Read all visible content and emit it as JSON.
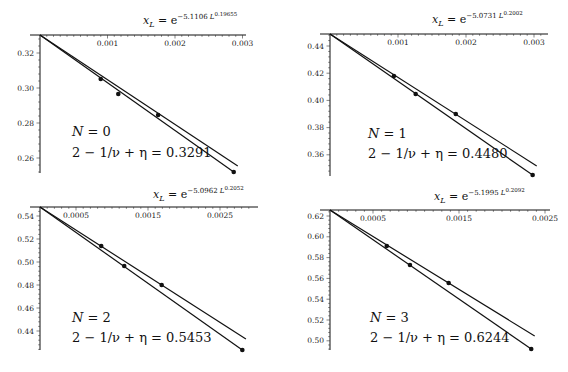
{
  "chart_data": [
    {
      "type": "line",
      "panel": "top-left",
      "title": "x_L = e^{-5.1106 L^{0.19655}}",
      "title_parts": {
        "var": "x",
        "sub": "L",
        "eq": " = e",
        "exp": "−5.1106 L",
        "exp2": "0.19655"
      },
      "annotation": {
        "line1": "N = 0",
        "line2": "2 − 1/ν + η = 0.3291"
      },
      "xlabel": "x_L",
      "ylabel": "",
      "x_ticks": [
        "0.001",
        "0.002",
        "0.003"
      ],
      "x_tick_values": [
        0.001,
        0.002,
        0.003
      ],
      "y_ticks": [
        "0.32",
        "0.30",
        "0.28",
        "0.26"
      ],
      "y_tick_values": [
        0.32,
        0.3,
        0.28,
        0.26
      ],
      "xlim": [
        0,
        0.003
      ],
      "ylim": [
        0.249,
        0.3291
      ],
      "intercept": 0.3291,
      "series": [
        {
          "name": "points",
          "x": [
            0.0009,
            0.00116,
            0.00175,
            0.00287
          ],
          "y": [
            0.3051,
            0.2966,
            0.2846,
            0.252
          ]
        },
        {
          "name": "fit upper",
          "x": [
            0,
            0.00293
          ],
          "y": [
            0.3291,
            0.2554
          ]
        },
        {
          "name": "fit lower",
          "x": [
            0,
            0.00287
          ],
          "y": [
            0.3291,
            0.252
          ]
        }
      ],
      "grid": false
    },
    {
      "type": "line",
      "panel": "top-right",
      "title": "x_L = e^{-5.0731 L^{0.2002}}",
      "title_parts": {
        "var": "x",
        "sub": "L",
        "eq": " = e",
        "exp": "−5.0731 L",
        "exp2": "0.2002"
      },
      "annotation": {
        "line1": "N = 1",
        "line2": "2 − 1/ν + η = 0.4480"
      },
      "xlabel": "x_L",
      "ylabel": "",
      "x_ticks": [
        "0.001",
        "0.002",
        "0.003"
      ],
      "x_tick_values": [
        0.001,
        0.002,
        0.003
      ],
      "y_ticks": [
        "0.44",
        "0.42",
        "0.40",
        "0.38",
        "0.36"
      ],
      "y_tick_values": [
        0.44,
        0.42,
        0.4,
        0.38,
        0.36
      ],
      "xlim": [
        0,
        0.0031
      ],
      "ylim": [
        0.343,
        0.448
      ],
      "intercept": 0.448,
      "series": [
        {
          "name": "points",
          "x": [
            0.00094,
            0.00126,
            0.00185,
            0.00298
          ],
          "y": [
            0.4179,
            0.4047,
            0.39,
            0.3451
          ]
        },
        {
          "name": "fit upper",
          "x": [
            0,
            0.00304
          ],
          "y": [
            0.448,
            0.3518
          ]
        },
        {
          "name": "fit lower",
          "x": [
            0,
            0.00298
          ],
          "y": [
            0.448,
            0.3451
          ]
        }
      ],
      "grid": false
    },
    {
      "type": "line",
      "panel": "bottom-left",
      "title": "x_L = e^{-5.0962 L^{0.2052}}",
      "title_parts": {
        "var": "x",
        "sub": "L",
        "eq": " = e",
        "exp": "−5.0962 L",
        "exp2": "0.2052"
      },
      "annotation": {
        "line1": "N = 2",
        "line2": "2 − 1/ν + η = 0.5453"
      },
      "xlabel": "x_L",
      "ylabel": "",
      "x_ticks": [
        "0.0005",
        "0.0015",
        "0.0025"
      ],
      "x_tick_values": [
        0.0005,
        0.0015,
        0.0025
      ],
      "y_ticks": [
        "0.54",
        "0.52",
        "0.50",
        "0.48",
        "0.46",
        "0.44"
      ],
      "y_tick_values": [
        0.54,
        0.52,
        0.5,
        0.48,
        0.46,
        0.44
      ],
      "xlim": [
        0,
        0.0029
      ],
      "ylim": [
        0.422,
        0.5453
      ],
      "intercept": 0.5453,
      "series": [
        {
          "name": "points",
          "x": [
            0.00085,
            0.00117,
            0.00169,
            0.00281
          ],
          "y": [
            0.5139,
            0.4965,
            0.48,
            0.4235
          ]
        },
        {
          "name": "fit upper",
          "x": [
            0,
            0.00286
          ],
          "y": [
            0.5453,
            0.433
          ]
        },
        {
          "name": "fit lower",
          "x": [
            0,
            0.00281
          ],
          "y": [
            0.5453,
            0.4235
          ]
        }
      ],
      "grid": false
    },
    {
      "type": "line",
      "panel": "bottom-right",
      "title": "x_L = e^{-5.1995 L^{0.2092}}",
      "title_parts": {
        "var": "x",
        "sub": "L",
        "eq": " = e",
        "exp": "−5.1995 L",
        "exp2": "0.2092"
      },
      "annotation": {
        "line1": "N = 3",
        "line2": "2 − 1/ν + η = 0.6244"
      },
      "xlabel": "x_L",
      "ylabel": "",
      "x_ticks": [
        "0.0005",
        "0.0015",
        "0.0025"
      ],
      "x_tick_values": [
        0.0005,
        0.0015,
        0.0025
      ],
      "y_ticks": [
        "0.62",
        "0.60",
        "0.58",
        "0.56",
        "0.54",
        "0.52",
        "0.50"
      ],
      "y_tick_values": [
        0.62,
        0.6,
        0.58,
        0.56,
        0.54,
        0.52,
        0.5
      ],
      "xlim": [
        0,
        0.00252
      ],
      "ylim": [
        0.491,
        0.6244
      ],
      "intercept": 0.6244,
      "series": [
        {
          "name": "points",
          "x": [
            0.00066,
            0.00093,
            0.00138,
            0.00234
          ],
          "y": [
            0.5912,
            0.5729,
            0.5556,
            0.4921
          ]
        },
        {
          "name": "fit upper",
          "x": [
            0,
            0.00238
          ],
          "y": [
            0.6244,
            0.5046
          ]
        },
        {
          "name": "fit lower",
          "x": [
            0,
            0.00234
          ],
          "y": [
            0.6244,
            0.4921
          ]
        }
      ],
      "grid": false
    }
  ],
  "layout": {
    "panels": [
      {
        "ox": 40,
        "oy": 35,
        "x_end": 243,
        "x_px_per_unit": 67500,
        "y_ref": 0.32,
        "y_ref_px": 53,
        "y_px_per_unit": 1750,
        "y_axis_bottom": 173
      },
      {
        "ox": 330,
        "oy": 34,
        "x_end": 545,
        "x_px_per_unit": 68000,
        "y_ref": 0.44,
        "y_ref_px": 46,
        "y_px_per_unit": 1360,
        "y_axis_bottom": 176
      },
      {
        "ox": 40,
        "oy": 207,
        "x_end": 255,
        "x_px_per_unit": 72000,
        "y_ref": 0.54,
        "y_ref_px": 216,
        "y_px_per_unit": 1150,
        "y_axis_bottom": 350
      },
      {
        "ox": 330,
        "oy": 210,
        "x_end": 547,
        "x_px_per_unit": 86000,
        "y_ref": 0.62,
        "y_ref_px": 216,
        "y_px_per_unit": 1040,
        "y_axis_bottom": 350
      }
    ],
    "titles": [
      {
        "x": 143,
        "y": 24
      },
      {
        "x": 432,
        "y": 23
      },
      {
        "x": 153,
        "y": 198
      },
      {
        "x": 434,
        "y": 200
      }
    ],
    "annots": [
      {
        "x": 72,
        "y1": 136,
        "y2": 157
      },
      {
        "x": 368,
        "y1": 138,
        "y2": 158
      },
      {
        "x": 72,
        "y1": 322,
        "y2": 342
      },
      {
        "x": 370,
        "y1": 322,
        "y2": 342
      }
    ]
  }
}
